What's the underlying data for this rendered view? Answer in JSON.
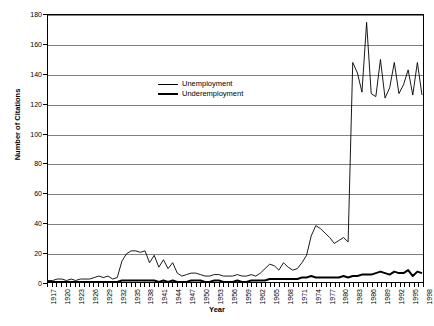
{
  "chart_data": {
    "type": "line",
    "title": "",
    "xlabel": "Year",
    "ylabel": "Number of Citations",
    "xlim": [
      1917,
      1998
    ],
    "ylim": [
      0,
      180
    ],
    "ytick_step": 20,
    "yticks": [
      0,
      20,
      40,
      60,
      80,
      100,
      120,
      140,
      160,
      180
    ],
    "xtick_labels": [
      "1917",
      "1920",
      "1923",
      "1926",
      "1929",
      "1932",
      "1935",
      "1938",
      "1941",
      "1944",
      "1947",
      "1950",
      "1953",
      "1956",
      "1959",
      "1962",
      "1965",
      "1968",
      "1971",
      "1974",
      "1977",
      "1980",
      "1983",
      "1986",
      "1989",
      "1992",
      "1995",
      "1998"
    ],
    "xtick_step": 3,
    "grid": "horizontal",
    "legend_position": "upper-center",
    "x": [
      1917,
      1918,
      1919,
      1920,
      1921,
      1922,
      1923,
      1924,
      1925,
      1926,
      1927,
      1928,
      1929,
      1930,
      1931,
      1932,
      1933,
      1934,
      1935,
      1936,
      1937,
      1938,
      1939,
      1940,
      1941,
      1942,
      1943,
      1944,
      1945,
      1946,
      1947,
      1948,
      1949,
      1950,
      1951,
      1952,
      1953,
      1954,
      1955,
      1956,
      1957,
      1958,
      1959,
      1960,
      1961,
      1962,
      1963,
      1964,
      1965,
      1966,
      1967,
      1968,
      1969,
      1970,
      1971,
      1972,
      1973,
      1974,
      1975,
      1976,
      1977,
      1978,
      1979,
      1980,
      1981,
      1982,
      1983,
      1984,
      1985,
      1986,
      1987,
      1988,
      1989,
      1990,
      1991,
      1992,
      1993,
      1994,
      1995,
      1996,
      1997,
      1998
    ],
    "series": [
      {
        "name": "Unemployment",
        "style": "thin",
        "color": "#000000",
        "values": [
          1,
          1,
          2,
          2,
          1,
          2,
          1,
          2,
          2,
          2,
          3,
          4,
          3,
          4,
          2,
          3,
          14,
          19,
          21,
          21,
          20,
          21,
          13,
          18,
          10,
          15,
          9,
          13,
          6,
          4,
          5,
          6,
          6,
          5,
          4,
          4,
          5,
          5,
          4,
          4,
          4,
          5,
          4,
          4,
          5,
          4,
          6,
          9,
          12,
          11,
          8,
          13,
          10,
          8,
          9,
          13,
          18,
          31,
          38,
          36,
          33,
          30,
          26,
          28,
          30,
          27,
          148,
          141,
          128,
          175,
          127,
          125,
          150,
          124,
          131,
          148,
          127,
          133,
          143,
          126,
          148,
          126
        ]
      },
      {
        "name": "Underemployment",
        "style": "thick",
        "color": "#000000",
        "values": [
          0,
          0,
          0,
          0,
          0,
          0,
          0,
          0,
          0,
          0,
          0,
          0,
          0,
          0,
          0,
          0,
          1,
          1,
          1,
          1,
          1,
          1,
          1,
          1,
          0,
          1,
          0,
          1,
          0,
          0,
          0,
          1,
          1,
          1,
          0,
          0,
          1,
          1,
          0,
          0,
          0,
          1,
          0,
          0,
          1,
          1,
          1,
          1,
          2,
          2,
          2,
          2,
          2,
          2,
          2,
          3,
          3,
          4,
          3,
          3,
          3,
          3,
          3,
          3,
          4,
          3,
          4,
          4,
          5,
          5,
          5,
          6,
          7,
          6,
          5,
          7,
          6,
          6,
          8,
          4,
          7,
          6
        ]
      }
    ]
  },
  "legend": {
    "items": [
      {
        "label": "Unemployment"
      },
      {
        "label": "Underemployment"
      }
    ]
  },
  "axes": {
    "x_title": "Year",
    "y_title": "Number of Citations"
  }
}
